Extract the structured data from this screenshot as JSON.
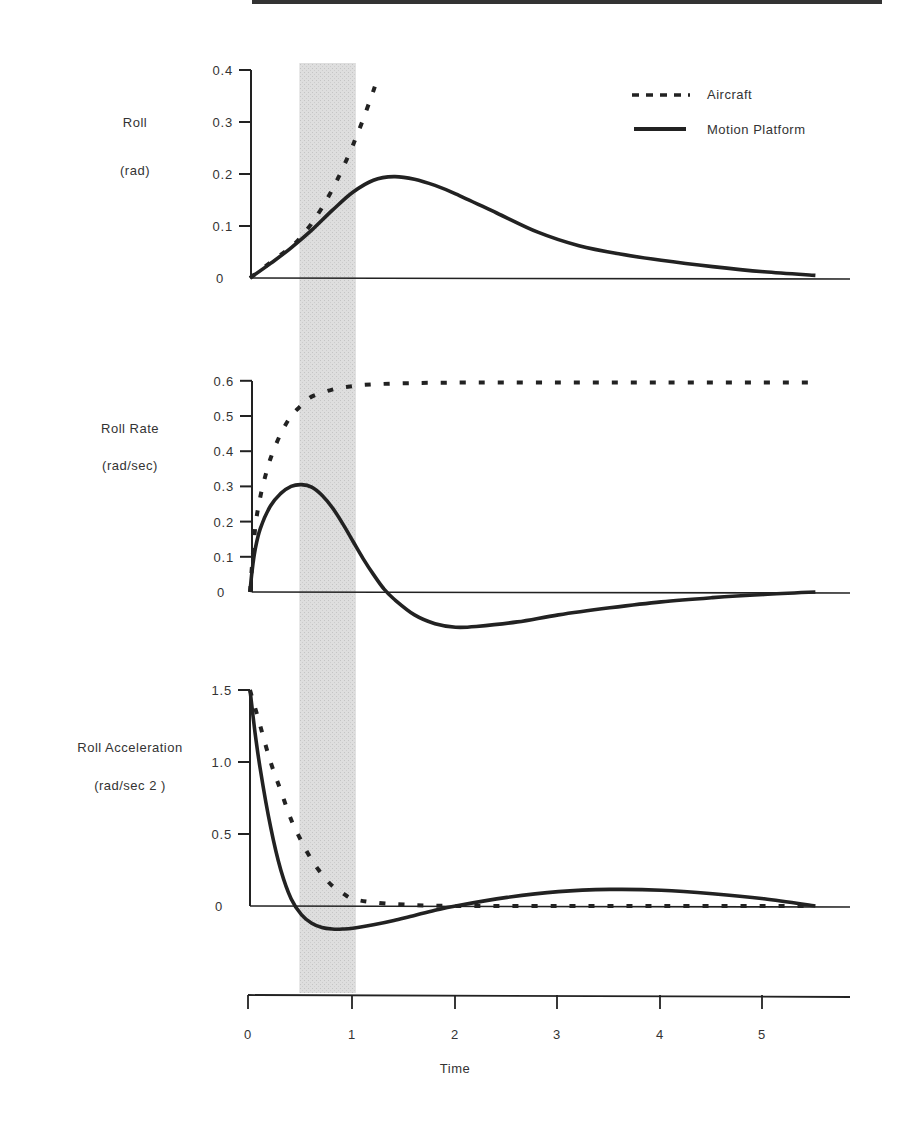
{
  "figure": {
    "shaded_band": {
      "t_start": 0.48,
      "t_end": 1.03,
      "color": "#d9d9d9"
    },
    "line_color": "#222222",
    "legend": {
      "items": [
        {
          "label": "Aircraft",
          "style": "dashed"
        },
        {
          "label": "Motion Platform",
          "style": "solid"
        }
      ]
    },
    "x_axis": {
      "label": "Time",
      "ticks": [
        "0",
        "1",
        "2",
        "3",
        "4",
        "5"
      ]
    }
  },
  "chart_data": [
    {
      "type": "line",
      "title": "",
      "ylabel": "Roll",
      "yunit": "(rad)",
      "xlabel": "Time",
      "ylim": [
        0,
        0.4
      ],
      "xlim": [
        0,
        5.8
      ],
      "yticks": [
        "0",
        "0.1",
        "0.2",
        "0.3",
        "0.4"
      ],
      "series": [
        {
          "name": "Aircraft",
          "style": "dashed",
          "x": [
            0,
            0.2,
            0.4,
            0.5,
            0.6,
            0.7,
            0.8,
            0.9,
            1.0,
            1.1,
            1.2,
            1.25
          ],
          "y": [
            0.0,
            0.03,
            0.06,
            0.08,
            0.105,
            0.135,
            0.17,
            0.21,
            0.255,
            0.305,
            0.36,
            0.39
          ]
        },
        {
          "name": "Motion Platform",
          "style": "solid",
          "x": [
            0,
            0.2,
            0.4,
            0.6,
            0.8,
            1.0,
            1.2,
            1.4,
            1.6,
            1.8,
            2.0,
            2.4,
            2.8,
            3.2,
            3.6,
            4.0,
            4.5,
            5.0,
            5.5
          ],
          "y": [
            0.0,
            0.028,
            0.058,
            0.092,
            0.13,
            0.165,
            0.188,
            0.195,
            0.19,
            0.178,
            0.162,
            0.125,
            0.088,
            0.062,
            0.046,
            0.034,
            0.022,
            0.012,
            0.005
          ]
        }
      ]
    },
    {
      "type": "line",
      "title": "",
      "ylabel": "Roll Rate",
      "yunit": "(rad/sec)",
      "xlabel": "Time",
      "ylim": [
        0,
        0.6
      ],
      "xlim": [
        0,
        5.8
      ],
      "yticks": [
        "0",
        "0.1",
        "0.2",
        "0.3",
        "0.4",
        "0.5",
        "0.6"
      ],
      "series": [
        {
          "name": "Aircraft",
          "style": "dashed",
          "x": [
            0,
            0.05,
            0.1,
            0.15,
            0.2,
            0.3,
            0.4,
            0.5,
            0.6,
            0.8,
            1.0,
            1.2,
            1.5,
            2.0,
            3.0,
            4.0,
            5.0,
            5.5
          ],
          "y": [
            0.0,
            0.18,
            0.27,
            0.33,
            0.38,
            0.45,
            0.5,
            0.53,
            0.555,
            0.575,
            0.585,
            0.59,
            0.593,
            0.595,
            0.595,
            0.595,
            0.595,
            0.595
          ]
        },
        {
          "name": "Motion Platform",
          "style": "solid",
          "x": [
            0,
            0.02,
            0.05,
            0.1,
            0.2,
            0.3,
            0.4,
            0.5,
            0.6,
            0.7,
            0.8,
            0.9,
            1.0,
            1.1,
            1.2,
            1.3,
            1.4,
            1.6,
            1.8,
            2.0,
            2.2,
            2.6,
            3.0,
            3.5,
            4.0,
            4.5,
            5.0,
            5.5
          ],
          "y": [
            0.0,
            0.06,
            0.12,
            0.18,
            0.245,
            0.28,
            0.3,
            0.305,
            0.298,
            0.275,
            0.24,
            0.195,
            0.145,
            0.095,
            0.05,
            0.01,
            -0.02,
            -0.065,
            -0.09,
            -0.1,
            -0.098,
            -0.085,
            -0.065,
            -0.045,
            -0.028,
            -0.016,
            -0.007,
            0.0
          ]
        }
      ]
    },
    {
      "type": "line",
      "title": "",
      "ylabel": "Roll Acceleration",
      "yunit": "(rad/sec 2 )",
      "xlabel": "Time",
      "ylim": [
        -0.5,
        1.5
      ],
      "xlim": [
        0,
        5.8
      ],
      "yticks": [
        "0",
        "0.5",
        "1.0",
        "1.5"
      ],
      "series": [
        {
          "name": "Aircraft",
          "style": "dashed",
          "x": [
            0,
            0.1,
            0.2,
            0.3,
            0.4,
            0.5,
            0.6,
            0.7,
            0.8,
            0.9,
            1.0,
            1.2,
            1.5,
            2.0,
            3.0,
            4.0,
            5.0,
            5.5
          ],
          "y": [
            1.5,
            1.25,
            1.0,
            0.8,
            0.6,
            0.45,
            0.32,
            0.22,
            0.14,
            0.09,
            0.05,
            0.025,
            0.01,
            0.0,
            0.0,
            0.0,
            0.0,
            0.0
          ]
        },
        {
          "name": "Motion Platform",
          "style": "solid",
          "x": [
            0,
            0.05,
            0.1,
            0.2,
            0.3,
            0.4,
            0.5,
            0.6,
            0.7,
            0.8,
            0.9,
            1.0,
            1.2,
            1.4,
            1.6,
            1.8,
            2.0,
            2.5,
            3.0,
            3.5,
            4.0,
            4.5,
            5.0,
            5.5
          ],
          "y": [
            1.5,
            1.2,
            0.95,
            0.55,
            0.25,
            0.05,
            -0.06,
            -0.12,
            -0.15,
            -0.16,
            -0.16,
            -0.155,
            -0.13,
            -0.1,
            -0.065,
            -0.03,
            0.0,
            0.06,
            0.1,
            0.115,
            0.11,
            0.085,
            0.05,
            0.0
          ]
        }
      ]
    }
  ]
}
